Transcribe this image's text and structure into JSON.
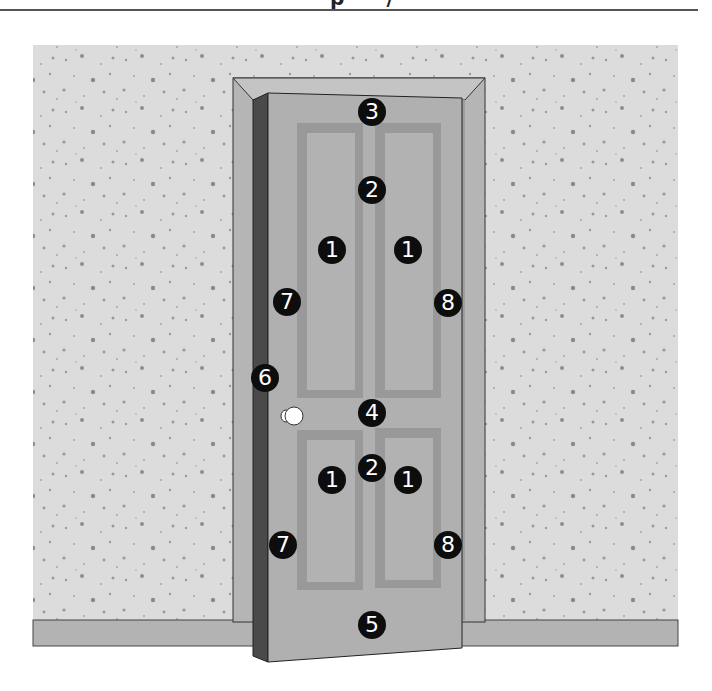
{
  "header": {
    "partial_text": "p    ·   ·   /"
  },
  "diagram": {
    "colors": {
      "wall": "#dcdcdc",
      "wall_speck": "#9a9a9a",
      "baseboard": "#b3b3b3",
      "frame": "#b5b5b5",
      "frame_bevel": "#c4c4c4",
      "door_face": "#b0b0b0",
      "panel_molding": "#999999",
      "door_edge": "#4a4a4a",
      "marker_fill": "#0d0d0d",
      "marker_text": "#ffffff",
      "knob": "#ffffff"
    },
    "markers": [
      {
        "label": "3",
        "x": 372,
        "y": 112
      },
      {
        "label": "2",
        "x": 372,
        "y": 190
      },
      {
        "label": "1",
        "x": 332,
        "y": 250
      },
      {
        "label": "1",
        "x": 408,
        "y": 250
      },
      {
        "label": "7",
        "x": 287,
        "y": 302
      },
      {
        "label": "8",
        "x": 448,
        "y": 303
      },
      {
        "label": "6",
        "x": 265,
        "y": 378
      },
      {
        "label": "4",
        "x": 372,
        "y": 413
      },
      {
        "label": "2",
        "x": 372,
        "y": 468
      },
      {
        "label": "1",
        "x": 332,
        "y": 480
      },
      {
        "label": "1",
        "x": 408,
        "y": 480
      },
      {
        "label": "7",
        "x": 283,
        "y": 545
      },
      {
        "label": "8",
        "x": 448,
        "y": 545
      },
      {
        "label": "5",
        "x": 372,
        "y": 625
      }
    ]
  }
}
